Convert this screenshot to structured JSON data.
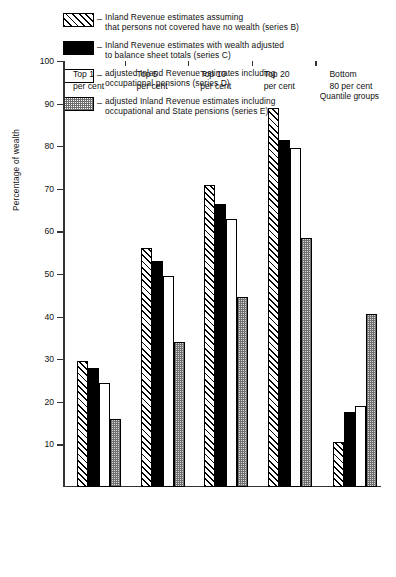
{
  "legend": {
    "dash": "–",
    "items": [
      {
        "swatch": "hatched-diagonal",
        "line1": "Inland Revenue estimates assuming",
        "line2": "that persons not covered have no wealth (series B)"
      },
      {
        "swatch": "solid-black",
        "line1": "Inland Revenue estimates with wealth adjusted",
        "line2": "to balance sheet totals (series C)"
      },
      {
        "swatch": "open-white",
        "line1": "adjusted Inland Revenue estimates including",
        "line2": "occupational pensions (series D)"
      },
      {
        "swatch": "dotted-grey",
        "line1": "adjusted Inland Revenue estimates including",
        "line2": "occupational and State pensions (series E)"
      }
    ]
  },
  "axes": {
    "y_title": "Percentage of wealth",
    "x_title": "Quantile groups",
    "y_ticks": [
      100,
      90,
      80,
      70,
      60,
      50,
      40,
      30,
      20,
      10
    ]
  },
  "categories_display": [
    {
      "line1": "Top 1",
      "line2": "per cent"
    },
    {
      "line1": "Top 5",
      "line2": "per cent"
    },
    {
      "line1": "Top 10",
      "line2": "per cent"
    },
    {
      "line1": "Top 20",
      "line2": "per cent"
    },
    {
      "line1": "Bottom",
      "line2": "80 per cent"
    }
  ],
  "chart_data": {
    "type": "bar",
    "title": "",
    "xlabel": "Quantile groups",
    "ylabel": "Percentage of wealth",
    "ylim": [
      0,
      100
    ],
    "ytick_step": 10,
    "grid": false,
    "legend_position": "top",
    "categories": [
      "Top 1 per cent",
      "Top 5 per cent",
      "Top 10 per cent",
      "Top 20 per cent",
      "Bottom 80 per cent"
    ],
    "series": [
      {
        "name": "Inland Revenue estimates assuming that persons not covered have no wealth (series B)",
        "short": "series B",
        "style": "hatched-diagonal",
        "values": [
          29.5,
          56,
          71,
          89,
          10.5
        ]
      },
      {
        "name": "Inland Revenue estimates with wealth adjusted to balance sheet totals (series C)",
        "short": "series C",
        "style": "solid-black",
        "values": [
          28,
          53,
          66.5,
          81.5,
          17.5
        ]
      },
      {
        "name": "adjusted Inland Revenue estimates including occupational pensions (series D)",
        "short": "series D",
        "style": "open-white",
        "values": [
          24.5,
          49.5,
          63,
          79.5,
          19
        ]
      },
      {
        "name": "adjusted Inland Revenue estimates including occupational and State pensions (series E)",
        "short": "series E",
        "style": "dotted-grey",
        "values": [
          16,
          34,
          44.5,
          58.5,
          40.5
        ]
      }
    ]
  }
}
